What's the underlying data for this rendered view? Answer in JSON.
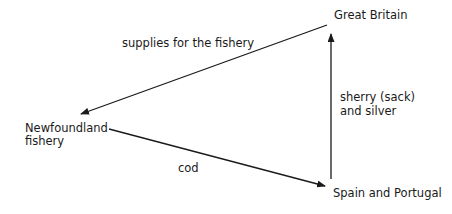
{
  "diagram": {
    "type": "triangular-trade-flow",
    "nodes": {
      "great_britain": "Great Britain",
      "newfoundland_line1": "Newfoundland",
      "newfoundland_line2": "fishery",
      "spain_portugal": "Spain and Portugal"
    },
    "edges": [
      {
        "from": "Great Britain",
        "to": "Newfoundland fishery",
        "label": "supplies for the fishery"
      },
      {
        "from": "Newfoundland fishery",
        "to": "Spain and Portugal",
        "label": "cod"
      },
      {
        "from": "Spain and Portugal",
        "to": "Great Britain",
        "label_line1": "sherry (sack)",
        "label_line2": "and silver"
      }
    ],
    "edge_labels": {
      "supplies": "supplies for the fishery",
      "cod": "cod",
      "sherry_line1": "sherry (sack)",
      "sherry_line2": "and silver"
    },
    "colors": {
      "line": "#1a1a1a",
      "text": "#1a1a1a",
      "background": "#ffffff"
    }
  }
}
